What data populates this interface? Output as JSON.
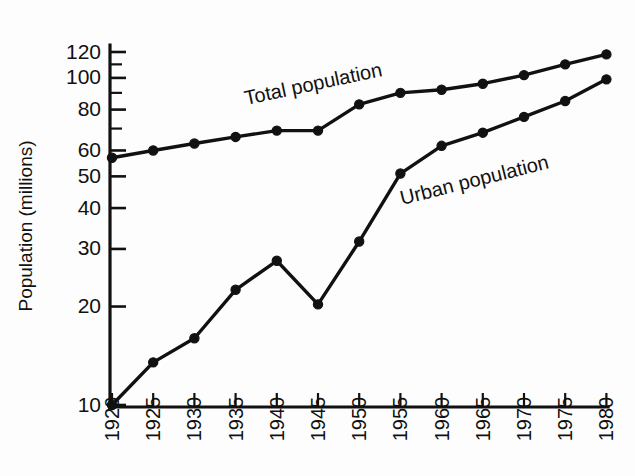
{
  "figure": {
    "background_color": "#fdfdfd",
    "ink_color": "#111111"
  },
  "axes": {
    "ylabel": "Population (millions)",
    "xlabel": "",
    "yscale": "log",
    "ylim": [
      10,
      125
    ],
    "xlim": [
      1918,
      1984
    ],
    "grid": "off",
    "y_ticks_labeled": [
      "10",
      "20",
      "30",
      "40",
      "50",
      "60",
      "80",
      "100",
      "120"
    ],
    "y_ticks_unlabeled": [
      "70",
      "90",
      "110"
    ],
    "x_ticks": [
      "1920",
      "1925",
      "1930",
      "1935",
      "1940",
      "1945",
      "1950",
      "1955",
      "1960",
      "1965",
      "1970",
      "1975",
      "1980"
    ]
  },
  "chart_data": {
    "type": "line",
    "title": "",
    "xlabel": "",
    "ylabel": "Population (millions)",
    "yscale": "log",
    "ylim": [
      10,
      125
    ],
    "xlim": [
      1918,
      1984
    ],
    "grid": false,
    "legend_position": "inline-labels",
    "x": [
      1920,
      1925,
      1930,
      1935,
      1940,
      1945,
      1950,
      1955,
      1960,
      1965,
      1970,
      1975,
      1980
    ],
    "series": [
      {
        "name": "Total population",
        "label": "Total population",
        "marker": "filled-circle",
        "values": [
          57,
          60,
          63,
          66,
          69,
          69,
          83,
          90,
          92,
          96,
          102,
          110,
          118
        ]
      },
      {
        "name": "Urban population",
        "label": "Urban population",
        "marker": "filled-circle",
        "values": [
          10,
          13.5,
          16,
          22.5,
          27.6,
          20.3,
          31.6,
          51,
          62,
          68,
          76,
          85,
          99
        ]
      }
    ],
    "annotations": [
      {
        "text": "Total population",
        "near_x": 1940,
        "rotation": -12
      },
      {
        "text": "Urban population",
        "near_x": 1958,
        "rotation": -14
      }
    ]
  },
  "geometry": {
    "plot_left": 110,
    "plot_right": 608,
    "plot_top": 45,
    "plot_bottom": 407,
    "y_at_10": 405,
    "y_at_120": 52,
    "x_first_tick": 112,
    "x_tick_step": 41.2
  }
}
